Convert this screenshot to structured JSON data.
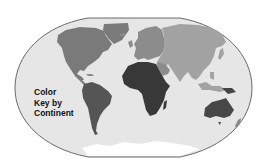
{
  "map": {
    "title_lines": [
      "Color",
      "Key by",
      "Continent"
    ],
    "projection": "world-elliptical",
    "colors": {
      "ocean": "#e6e6e6",
      "border": "#6a6a6a",
      "north_america": "#7a7a7a",
      "south_america": "#555555",
      "europe": "#8c8c8c",
      "asia": "#a2a2a2",
      "africa": "#383838",
      "australia": "#474747",
      "antarctica": "#ffffff"
    },
    "continents": [
      {
        "name": "North America",
        "shade": "medium-gray"
      },
      {
        "name": "South America",
        "shade": "dark-gray"
      },
      {
        "name": "Europe",
        "shade": "medium-gray"
      },
      {
        "name": "Asia",
        "shade": "light-gray"
      },
      {
        "name": "Africa",
        "shade": "darkest-gray"
      },
      {
        "name": "Australia",
        "shade": "dark-gray"
      },
      {
        "name": "Antarctica",
        "shade": "white"
      }
    ]
  }
}
